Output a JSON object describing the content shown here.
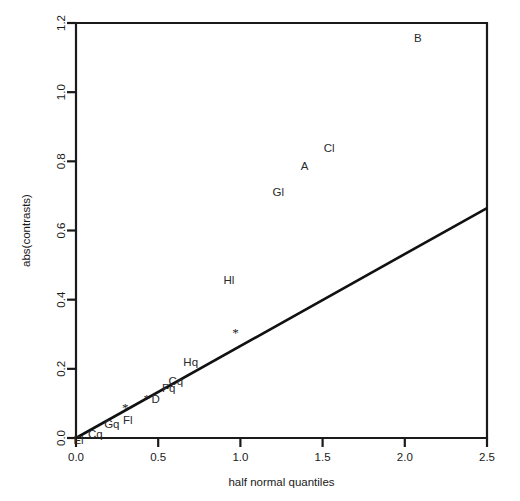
{
  "chart_data": {
    "type": "scatter",
    "title": "",
    "xlabel": "half normal quantiles",
    "ylabel": "abs(contrasts)",
    "xlim": [
      0.0,
      2.5
    ],
    "ylim": [
      0.0,
      1.2
    ],
    "grid": false,
    "legend": null,
    "xticks": [
      "0.0",
      "0.5",
      "1.0",
      "1.5",
      "2.0",
      "2.5"
    ],
    "xtickvalues": [
      0.0,
      0.5,
      1.0,
      1.5,
      2.0,
      2.5
    ],
    "yticks": [
      "0.0",
      "0.2",
      "0.4",
      "0.6",
      "0.8",
      "1.0",
      "1.2"
    ],
    "ytickvalues": [
      0.0,
      0.2,
      0.4,
      0.6,
      0.8,
      1.0,
      1.2
    ],
    "points": [
      {
        "label": "El",
        "x": 0.04,
        "y": 0.012,
        "marker": "text",
        "dx": -4,
        "dy": 6
      },
      {
        "label": "Cq",
        "x": 0.13,
        "y": 0.032,
        "marker": "text",
        "dx": -2,
        "dy": 7
      },
      {
        "label": "Gq",
        "x": 0.23,
        "y": 0.058,
        "marker": "text",
        "dx": -2,
        "dy": 6
      },
      {
        "label": "Fl",
        "x": 0.34,
        "y": 0.087,
        "marker": "text",
        "dx": -4,
        "dy": 12
      },
      {
        "label": "D",
        "x": 0.46,
        "y": 0.118,
        "marker": "text",
        "dx": 4,
        "dy": 2
      },
      {
        "label": "Fq",
        "x": 0.54,
        "y": 0.14,
        "marker": "text",
        "dx": 4,
        "dy": -2
      },
      {
        "label": "Cq",
        "x": 0.62,
        "y": 0.182,
        "marker": "text",
        "dx": -2,
        "dy": 6
      },
      {
        "label": "Hq",
        "x": 0.71,
        "y": 0.232,
        "marker": "text",
        "dx": -2,
        "dy": 4
      },
      {
        "label": "Hl",
        "x": 0.93,
        "y": 0.458,
        "marker": "text",
        "dx": 0,
        "dy": 0
      },
      {
        "label": "Gl",
        "x": 1.23,
        "y": 0.71,
        "marker": "text",
        "dx": 0,
        "dy": 0
      },
      {
        "label": "A",
        "x": 1.39,
        "y": 0.787,
        "marker": "text",
        "dx": 0,
        "dy": 0
      },
      {
        "label": "Cl",
        "x": 1.54,
        "y": 0.84,
        "marker": "text",
        "dx": 0,
        "dy": 0
      },
      {
        "label": "B",
        "x": 2.08,
        "y": 1.158,
        "marker": "text",
        "dx": 0,
        "dy": 0
      }
    ],
    "star_markers": [
      {
        "x": 0.3,
        "y": 0.087
      },
      {
        "x": 0.43,
        "y": 0.112
      },
      {
        "x": 0.97,
        "y": 0.305
      }
    ],
    "reference_line": {
      "type": "line",
      "x": [
        0.0,
        2.5
      ],
      "y": [
        0.0,
        0.665
      ]
    }
  }
}
